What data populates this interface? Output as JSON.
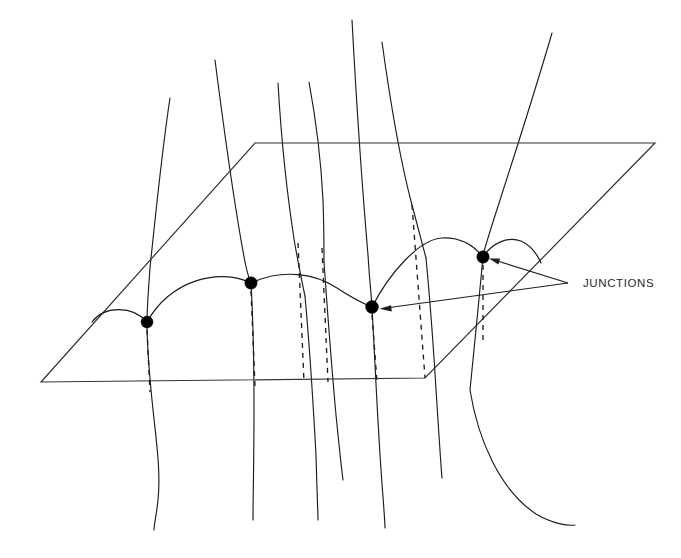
{
  "figure": {
    "background_color": "#ffffff",
    "line_color": "#1d1d1d",
    "width": 681,
    "height": 558
  },
  "callout": {
    "label": "JUNCTIONS",
    "text_x": 583,
    "text_y": 284,
    "vertex_x": 568,
    "vertex_y": 283,
    "targets": [
      {
        "name": "junction-right",
        "x": 489,
        "y": 260
      },
      {
        "name": "junction-center",
        "x": 380,
        "y": 308
      }
    ]
  },
  "plane": {
    "name": "reference-plane",
    "corners": [
      {
        "x": 41,
        "y": 382
      },
      {
        "x": 255,
        "y": 143
      },
      {
        "x": 655,
        "y": 143
      },
      {
        "x": 425,
        "y": 378
      }
    ],
    "path": "M 41 382 L 255 143 L 655 143 L 425 378 Z"
  },
  "junctions": [
    {
      "id": "j0",
      "x": 92,
      "y": 322,
      "r": 0
    },
    {
      "id": "j1",
      "x": 147,
      "y": 322,
      "r": 6.0
    },
    {
      "id": "j2",
      "x": 251,
      "y": 283,
      "r": 6.2
    },
    {
      "id": "j3",
      "x": 372,
      "y": 307,
      "r": 6.4
    },
    {
      "id": "j4",
      "x": 483,
      "y": 257,
      "r": 6.2
    }
  ],
  "arcs": [
    {
      "id": "arc-0",
      "d": "M 92 322 C 104 306 132 305 147 322"
    },
    {
      "id": "arc-1",
      "d": "M 147 322 C 170 281 218 267 251 283"
    },
    {
      "id": "arc-2",
      "d": "M 251 283 C 283 268 316 274 337 288 C 352 298 362 303 372 307"
    },
    {
      "id": "arc-3",
      "d": "M 372 307 C 390 272 420 239 442 238 C 462 237 475 247 483 257"
    },
    {
      "id": "arc-4",
      "d": "M 483 257 C 492 243 508 236 521 241 C 532 246 538 256 541 263"
    }
  ],
  "flux_lines": [
    {
      "id": "f1",
      "d": "M 170 98 C 162 150 156 210 150 268 C 148 295 147 312 147 322"
    },
    {
      "id": "f1b",
      "d": "M 147 322 C 147 345 149 370 152 400 C 156 440 161 470 158 500 C 156 518 154 525 154 530"
    },
    {
      "id": "f2",
      "d": "M 215 60 C 224 130 236 215 245 262 C 248 276 250 281 251 283"
    },
    {
      "id": "f2b",
      "d": "M 251 283 C 253 318 254 360 254 410 C 254 460 253 500 253 520"
    },
    {
      "id": "f3",
      "d": "M 278 83 C 281 135 287 195 295 245 C 300 272 303 287 305 296"
    },
    {
      "id": "f3b",
      "d": "M 305 296 C 309 340 313 400 316 455 C 317 495 318 512 318 520"
    },
    {
      "id": "f4",
      "d": "M 309 82 C 316 120 321 160 323 200 C 324 228 324 250 324 262"
    },
    {
      "id": "f4b",
      "d": "M 324 262 C 327 305 331 360 336 415 C 340 455 342 472 343 480"
    },
    {
      "id": "f5",
      "d": "M 352 20 C 356 95 362 185 368 255 C 370 288 372 302 372 307"
    },
    {
      "id": "f5b",
      "d": "M 372 307 C 374 350 377 405 380 455 C 383 500 385 520 385 528"
    },
    {
      "id": "f6",
      "d": "M 382 42 C 390 100 400 160 412 205 C 420 235 424 250 426 258"
    },
    {
      "id": "f6b",
      "d": "M 426 258 C 430 300 434 355 437 405 C 440 450 441 468 442 478"
    },
    {
      "id": "f7",
      "d": "M 552 33 C 531 105 508 175 492 225 C 486 245 483 253 483 257"
    },
    {
      "id": "f7b",
      "d": "M 483 257 C 479 300 474 350 470 390 C 478 440 500 490 536 514 C 553 524 568 526 575 525"
    }
  ],
  "dashed_drops": [
    {
      "id": "d1",
      "x1": 147,
      "y1": 330,
      "x2": 150,
      "y2": 392
    },
    {
      "id": "d2",
      "x1": 251,
      "y1": 291,
      "x2": 255,
      "y2": 386
    },
    {
      "id": "d3",
      "x1": 298,
      "y1": 243,
      "x2": 304,
      "y2": 382
    },
    {
      "id": "d4",
      "x1": 322,
      "y1": 248,
      "x2": 328,
      "y2": 382
    },
    {
      "id": "d5",
      "x1": 372,
      "y1": 315,
      "x2": 377,
      "y2": 382
    },
    {
      "id": "d6",
      "x1": 412,
      "y1": 205,
      "x2": 425,
      "y2": 378
    },
    {
      "id": "d7",
      "x1": 483,
      "y1": 265,
      "x2": 483,
      "y2": 340
    }
  ]
}
